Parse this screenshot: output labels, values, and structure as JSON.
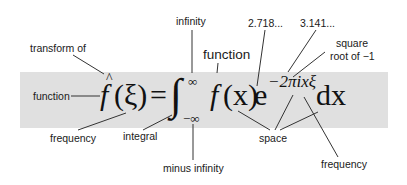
{
  "diagram": {
    "formula": {
      "lhs_hat": "^",
      "lhs_f": "f",
      "lhs_arg": "(ξ)",
      "equals": "=",
      "integral": "∫",
      "upper_limit": "∞",
      "lower_limit": "−∞",
      "integrand_f": "f",
      "integrand_arg": "(x)",
      "exp_base": "e",
      "exponent": "−2πixξ",
      "differential": "dx"
    },
    "annotations": {
      "transform_of": "transform of",
      "function_left": "function",
      "frequency_left": "frequency",
      "integral": "integral",
      "infinity": "infinity",
      "minus_infinity": "minus infinity",
      "function_right": "function",
      "e_value": "2.718...",
      "pi_value": "3.141...",
      "sqrt_line1": "square",
      "sqrt_line2": "root of −1",
      "space": "space",
      "frequency_right": "frequency"
    },
    "colors": {
      "band": "#e0e0e0",
      "text": "#1a1a1a",
      "leader_lines": "#333333"
    }
  }
}
